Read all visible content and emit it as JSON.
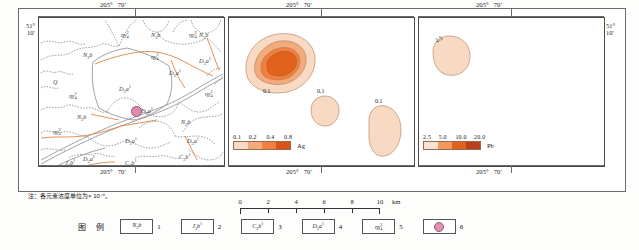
{
  "figure": {
    "note": "注：各元素浓度单位为× 10⁻⁶。",
    "legend_title": "图 例"
  },
  "graticule": {
    "lon_deg": "205°",
    "lon_min": "70′",
    "lat_deg": "51°",
    "lat_min": "10′"
  },
  "panels": [
    {
      "id": "geology-map",
      "name": "geological-map",
      "labels": [
        {
          "text": "N₂b",
          "x": 52,
          "y": 38
        },
        {
          "text": "N₂b",
          "x": 120,
          "y": 18
        },
        {
          "text": "N₂b",
          "x": 190,
          "y": 18
        },
        {
          "text": "N₂b",
          "x": 46,
          "y": 98
        },
        {
          "text": "N₂b",
          "x": 168,
          "y": 103
        },
        {
          "text": "Q",
          "x": 22,
          "y": 66
        },
        {
          "text": "ηγ₄²",
          "x": 40,
          "y": 80
        },
        {
          "text": "ηγ₄²",
          "x": 90,
          "y": 18
        },
        {
          "text": "ηγ₄²",
          "x": 170,
          "y": 18
        },
        {
          "text": "ηγ₄²",
          "x": 140,
          "y": 40
        },
        {
          "text": "ηγ₄²",
          "x": 186,
          "y": 78
        },
        {
          "text": "ηγ₄²",
          "x": 22,
          "y": 118
        },
        {
          "text": "D₃a¹",
          "x": 96,
          "y": 72
        },
        {
          "text": "D₃a¹",
          "x": 156,
          "y": 56
        },
        {
          "text": "D₃a¹",
          "x": 182,
          "y": 44
        },
        {
          "text": "D₃a¹",
          "x": 118,
          "y": 96
        },
        {
          "text": "D₃a¹",
          "x": 104,
          "y": 126
        },
        {
          "text": "D₃a¹",
          "x": 168,
          "y": 128
        },
        {
          "text": "D₃a¹",
          "x": 60,
          "y": 148
        },
        {
          "text": "C₂b¹",
          "x": 104,
          "y": 152
        },
        {
          "text": "C₂b¹",
          "x": 160,
          "y": 146
        },
        {
          "text": "J₃b¹",
          "x": 40,
          "y": 155
        }
      ],
      "ore_point": {
        "x": 108,
        "y": 105
      }
    },
    {
      "id": "ag-anomaly-map",
      "name": "silver-anomaly-map",
      "element": "Ag",
      "breaks": [
        "0.1",
        "0.2",
        "0.4",
        "0.8"
      ],
      "colors": [
        "#f7d9c4",
        "#f3ab7d",
        "#ef8040",
        "#d9541a"
      ],
      "contour_labels": [
        {
          "text": "0.1",
          "x": 36,
          "y": 76
        },
        {
          "text": "0.1",
          "x": 92,
          "y": 99
        },
        {
          "text": "0.1",
          "x": 148,
          "y": 115
        }
      ]
    },
    {
      "id": "pb-anomaly-map",
      "name": "lead-anomaly-map",
      "element": "Pb",
      "breaks": [
        "2.5",
        "5.0",
        "10.0",
        "20.0"
      ],
      "colors": [
        "#f8e2d2",
        "#f09a60",
        "#e2621d",
        "#b8401a"
      ],
      "contour_labels": [
        {
          "text": "2.5",
          "x": 22,
          "y": 24
        }
      ]
    }
  ],
  "scalebar": {
    "ticks": [
      "0",
      "2",
      "4",
      "6",
      "8",
      "10"
    ],
    "unit": "km"
  },
  "legend_items": [
    {
      "symbol": "N₂b",
      "num": "1"
    },
    {
      "symbol": "J₃b¹",
      "num": "2"
    },
    {
      "symbol": "C₂b¹",
      "num": "3"
    },
    {
      "symbol": "D₃a¹",
      "num": "4"
    },
    {
      "symbol": "ηγ₄²",
      "num": "5"
    },
    {
      "symbol": "",
      "num": "6",
      "icon": "deposit-dot"
    }
  ]
}
